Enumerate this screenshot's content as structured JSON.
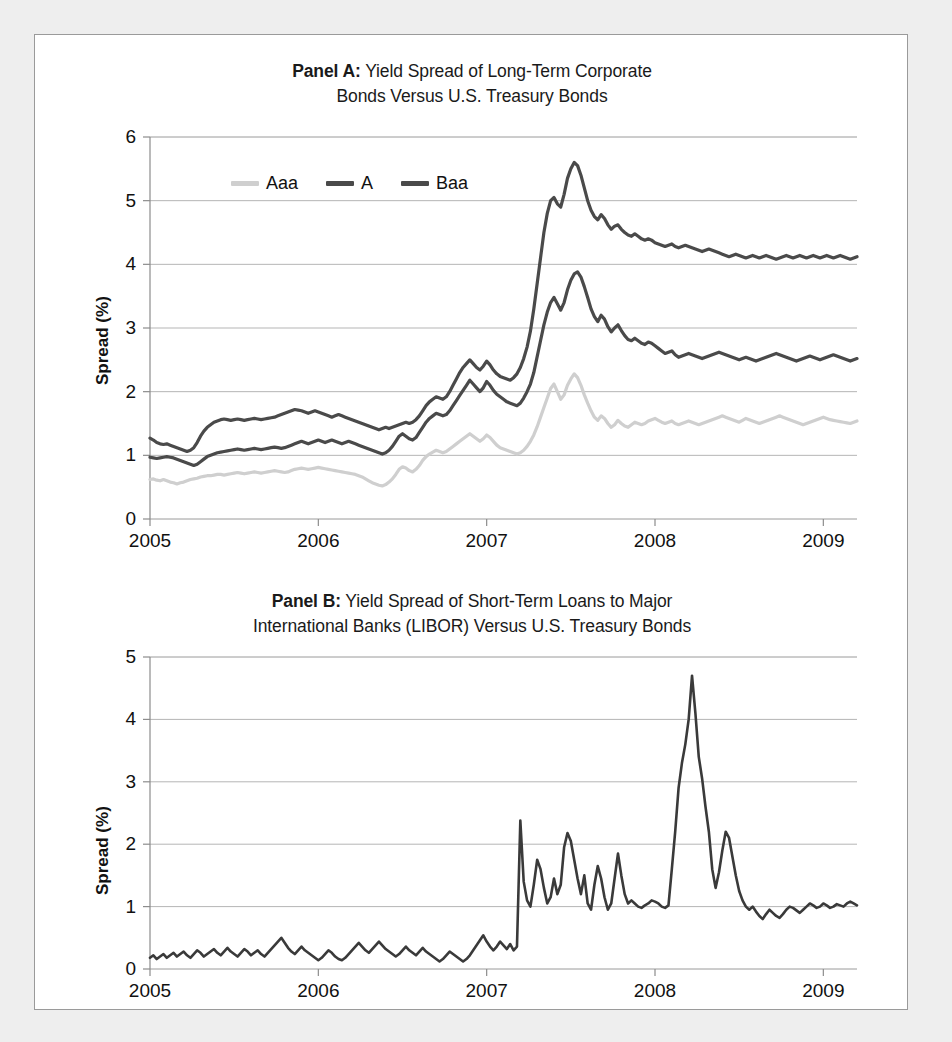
{
  "figure": {
    "background_color": "#eeeeee",
    "card_color": "#ffffff",
    "frame_color": "#9a9a9a"
  },
  "panel_a": {
    "title_lead": "Panel A:",
    "title_rest": " Yield Spread of Long-Term Corporate",
    "title_line2": "Bonds Versus U.S. Treasury Bonds",
    "ylabel": "Spread (%)",
    "yticks": [
      "0",
      "1",
      "2",
      "3",
      "4",
      "5",
      "6"
    ],
    "xticks": [
      "2005",
      "2006",
      "2007",
      "2008",
      "2009"
    ],
    "legend": [
      {
        "label": "Aaa",
        "color": "#cfcfcf"
      },
      {
        "label": "A",
        "color": "#4a4a4a"
      },
      {
        "label": "Baa",
        "color": "#4a4a4a"
      }
    ]
  },
  "panel_b": {
    "title_lead": "Panel B:",
    "title_rest": " Yield Spread of Short-Term Loans to Major",
    "title_line2": "International Banks (LIBOR) Versus U.S. Treasury Bonds",
    "ylabel": "Spread (%)",
    "yticks": [
      "0",
      "1",
      "2",
      "3",
      "4",
      "5"
    ],
    "xticks": [
      "2005",
      "2006",
      "2007",
      "2008",
      "2009"
    ]
  },
  "chart_data": [
    {
      "id": "panel-a",
      "type": "line",
      "title": "Panel A: Yield Spread of Long-Term Corporate Bonds Versus U.S. Treasury Bonds",
      "xlabel": "",
      "ylabel": "Spread (%)",
      "xlim": [
        2005.0,
        2009.2
      ],
      "ylim": [
        0,
        6
      ],
      "xticks": [
        2005,
        2006,
        2007,
        2008,
        2009
      ],
      "yticks": [
        0,
        1,
        2,
        3,
        4,
        5,
        6
      ],
      "grid": true,
      "legend_position": "top-left-inside",
      "x_step": 0.02,
      "series": [
        {
          "name": "Aaa",
          "color": "#cfcfcf",
          "values": [
            0.62,
            0.63,
            0.61,
            0.6,
            0.62,
            0.6,
            0.58,
            0.57,
            0.55,
            0.57,
            0.58,
            0.6,
            0.62,
            0.63,
            0.64,
            0.66,
            0.67,
            0.68,
            0.68,
            0.69,
            0.7,
            0.7,
            0.69,
            0.7,
            0.71,
            0.72,
            0.73,
            0.72,
            0.71,
            0.72,
            0.73,
            0.74,
            0.73,
            0.72,
            0.73,
            0.74,
            0.75,
            0.76,
            0.75,
            0.74,
            0.73,
            0.74,
            0.76,
            0.78,
            0.79,
            0.8,
            0.79,
            0.78,
            0.79,
            0.8,
            0.81,
            0.8,
            0.79,
            0.78,
            0.77,
            0.76,
            0.75,
            0.74,
            0.73,
            0.72,
            0.71,
            0.7,
            0.68,
            0.66,
            0.63,
            0.6,
            0.57,
            0.55,
            0.53,
            0.52,
            0.54,
            0.58,
            0.63,
            0.7,
            0.78,
            0.82,
            0.8,
            0.76,
            0.74,
            0.78,
            0.84,
            0.92,
            0.98,
            1.02,
            1.05,
            1.08,
            1.06,
            1.04,
            1.06,
            1.1,
            1.14,
            1.18,
            1.22,
            1.26,
            1.3,
            1.34,
            1.3,
            1.26,
            1.22,
            1.26,
            1.32,
            1.28,
            1.22,
            1.16,
            1.12,
            1.1,
            1.08,
            1.06,
            1.04,
            1.02,
            1.04,
            1.08,
            1.14,
            1.22,
            1.32,
            1.45,
            1.6,
            1.75,
            1.9,
            2.05,
            2.12,
            2.0,
            1.88,
            1.95,
            2.1,
            2.2,
            2.28,
            2.22,
            2.1,
            1.95,
            1.82,
            1.7,
            1.6,
            1.55,
            1.62,
            1.58,
            1.5,
            1.44,
            1.48,
            1.55,
            1.5,
            1.46,
            1.44,
            1.48,
            1.52,
            1.5,
            1.48,
            1.5,
            1.54,
            1.56,
            1.58,
            1.55,
            1.52,
            1.5,
            1.52,
            1.54,
            1.5,
            1.48,
            1.5,
            1.52,
            1.54,
            1.52,
            1.5,
            1.48,
            1.5,
            1.52,
            1.54,
            1.56,
            1.58,
            1.6,
            1.62,
            1.6,
            1.58,
            1.56,
            1.54,
            1.52,
            1.55,
            1.58,
            1.56,
            1.54,
            1.52,
            1.5,
            1.52,
            1.54,
            1.56,
            1.58,
            1.6,
            1.62,
            1.6,
            1.58,
            1.56,
            1.54,
            1.52,
            1.5,
            1.48,
            1.5,
            1.52,
            1.54,
            1.56,
            1.58,
            1.6,
            1.58,
            1.56,
            1.55,
            1.54,
            1.53,
            1.52,
            1.51,
            1.5,
            1.52,
            1.54
          ]
        },
        {
          "name": "A",
          "color": "#4a4a4a",
          "values": [
            0.97,
            0.96,
            0.95,
            0.96,
            0.97,
            0.98,
            0.97,
            0.96,
            0.94,
            0.92,
            0.9,
            0.88,
            0.86,
            0.84,
            0.86,
            0.9,
            0.94,
            0.98,
            1.0,
            1.02,
            1.04,
            1.05,
            1.06,
            1.07,
            1.08,
            1.09,
            1.1,
            1.09,
            1.08,
            1.09,
            1.1,
            1.11,
            1.1,
            1.09,
            1.1,
            1.11,
            1.12,
            1.13,
            1.12,
            1.11,
            1.12,
            1.14,
            1.16,
            1.18,
            1.2,
            1.22,
            1.2,
            1.18,
            1.2,
            1.22,
            1.24,
            1.22,
            1.2,
            1.22,
            1.24,
            1.22,
            1.2,
            1.18,
            1.2,
            1.22,
            1.2,
            1.18,
            1.16,
            1.14,
            1.12,
            1.1,
            1.08,
            1.06,
            1.04,
            1.02,
            1.04,
            1.08,
            1.14,
            1.22,
            1.3,
            1.34,
            1.3,
            1.26,
            1.24,
            1.28,
            1.36,
            1.44,
            1.52,
            1.58,
            1.62,
            1.66,
            1.64,
            1.62,
            1.64,
            1.7,
            1.78,
            1.86,
            1.94,
            2.02,
            2.1,
            2.18,
            2.12,
            2.06,
            2.0,
            2.06,
            2.16,
            2.1,
            2.02,
            1.96,
            1.92,
            1.88,
            1.84,
            1.82,
            1.8,
            1.78,
            1.82,
            1.9,
            2.0,
            2.12,
            2.3,
            2.55,
            2.8,
            3.05,
            3.25,
            3.4,
            3.48,
            3.38,
            3.28,
            3.4,
            3.6,
            3.75,
            3.85,
            3.88,
            3.8,
            3.65,
            3.48,
            3.3,
            3.18,
            3.1,
            3.2,
            3.14,
            3.02,
            2.94,
            3.0,
            3.05,
            2.96,
            2.88,
            2.82,
            2.8,
            2.84,
            2.8,
            2.76,
            2.74,
            2.78,
            2.76,
            2.72,
            2.68,
            2.64,
            2.6,
            2.62,
            2.64,
            2.58,
            2.54,
            2.56,
            2.58,
            2.6,
            2.58,
            2.56,
            2.54,
            2.52,
            2.54,
            2.56,
            2.58,
            2.6,
            2.62,
            2.6,
            2.58,
            2.56,
            2.54,
            2.52,
            2.5,
            2.52,
            2.54,
            2.52,
            2.5,
            2.48,
            2.5,
            2.52,
            2.54,
            2.56,
            2.58,
            2.6,
            2.58,
            2.56,
            2.54,
            2.52,
            2.5,
            2.48,
            2.5,
            2.52,
            2.54,
            2.56,
            2.54,
            2.52,
            2.5,
            2.52,
            2.54,
            2.56,
            2.58,
            2.56,
            2.54,
            2.52,
            2.5,
            2.48,
            2.5,
            2.52
          ]
        },
        {
          "name": "Baa",
          "color": "#4a4a4a",
          "values": [
            1.27,
            1.24,
            1.2,
            1.18,
            1.17,
            1.18,
            1.16,
            1.14,
            1.12,
            1.1,
            1.08,
            1.06,
            1.08,
            1.12,
            1.2,
            1.3,
            1.38,
            1.44,
            1.48,
            1.52,
            1.54,
            1.56,
            1.57,
            1.56,
            1.55,
            1.56,
            1.57,
            1.56,
            1.55,
            1.56,
            1.57,
            1.58,
            1.57,
            1.56,
            1.57,
            1.58,
            1.59,
            1.6,
            1.62,
            1.64,
            1.66,
            1.68,
            1.7,
            1.72,
            1.71,
            1.7,
            1.68,
            1.66,
            1.68,
            1.7,
            1.68,
            1.66,
            1.64,
            1.62,
            1.6,
            1.62,
            1.64,
            1.62,
            1.6,
            1.58,
            1.56,
            1.54,
            1.52,
            1.5,
            1.48,
            1.46,
            1.44,
            1.42,
            1.4,
            1.42,
            1.44,
            1.42,
            1.44,
            1.46,
            1.48,
            1.5,
            1.52,
            1.5,
            1.52,
            1.56,
            1.62,
            1.7,
            1.78,
            1.84,
            1.88,
            1.92,
            1.9,
            1.88,
            1.92,
            2.0,
            2.1,
            2.2,
            2.3,
            2.38,
            2.44,
            2.5,
            2.44,
            2.38,
            2.34,
            2.4,
            2.48,
            2.42,
            2.34,
            2.28,
            2.24,
            2.22,
            2.2,
            2.18,
            2.22,
            2.28,
            2.38,
            2.52,
            2.7,
            2.95,
            3.3,
            3.7,
            4.1,
            4.5,
            4.8,
            5.0,
            5.05,
            4.95,
            4.9,
            5.1,
            5.35,
            5.5,
            5.6,
            5.55,
            5.4,
            5.2,
            5.0,
            4.85,
            4.75,
            4.7,
            4.78,
            4.72,
            4.62,
            4.55,
            4.6,
            4.62,
            4.55,
            4.5,
            4.46,
            4.44,
            4.48,
            4.44,
            4.4,
            4.38,
            4.4,
            4.38,
            4.34,
            4.32,
            4.3,
            4.28,
            4.3,
            4.32,
            4.28,
            4.26,
            4.28,
            4.3,
            4.28,
            4.26,
            4.24,
            4.22,
            4.2,
            4.22,
            4.24,
            4.22,
            4.2,
            4.18,
            4.16,
            4.14,
            4.12,
            4.14,
            4.16,
            4.14,
            4.12,
            4.1,
            4.12,
            4.14,
            4.12,
            4.1,
            4.12,
            4.14,
            4.12,
            4.1,
            4.08,
            4.1,
            4.12,
            4.14,
            4.12,
            4.1,
            4.12,
            4.14,
            4.12,
            4.1,
            4.12,
            4.14,
            4.12,
            4.1,
            4.12,
            4.14,
            4.12,
            4.1,
            4.12,
            4.14,
            4.12,
            4.1,
            4.08,
            4.1,
            4.12
          ]
        }
      ]
    },
    {
      "id": "panel-b",
      "type": "line",
      "title": "Panel B: Yield Spread of Short-Term Loans to Major International Banks (LIBOR) Versus U.S. Treasury Bonds",
      "xlabel": "",
      "ylabel": "Spread (%)",
      "xlim": [
        2005.0,
        2009.2
      ],
      "ylim": [
        0,
        5
      ],
      "xticks": [
        2005,
        2006,
        2007,
        2008,
        2009
      ],
      "yticks": [
        0,
        1,
        2,
        3,
        4,
        5
      ],
      "grid": true,
      "legend_position": "none",
      "x_step": 0.02,
      "series": [
        {
          "name": "LIBOR spread",
          "color": "#3a3a3a",
          "values": [
            0.18,
            0.22,
            0.16,
            0.2,
            0.24,
            0.18,
            0.22,
            0.26,
            0.2,
            0.24,
            0.28,
            0.22,
            0.18,
            0.24,
            0.3,
            0.26,
            0.2,
            0.24,
            0.28,
            0.32,
            0.26,
            0.22,
            0.28,
            0.34,
            0.28,
            0.24,
            0.2,
            0.26,
            0.32,
            0.28,
            0.22,
            0.26,
            0.3,
            0.24,
            0.2,
            0.26,
            0.32,
            0.38,
            0.44,
            0.5,
            0.42,
            0.34,
            0.28,
            0.24,
            0.3,
            0.36,
            0.3,
            0.26,
            0.22,
            0.18,
            0.14,
            0.18,
            0.24,
            0.3,
            0.26,
            0.2,
            0.16,
            0.14,
            0.18,
            0.24,
            0.3,
            0.36,
            0.42,
            0.36,
            0.3,
            0.26,
            0.32,
            0.38,
            0.44,
            0.38,
            0.32,
            0.28,
            0.24,
            0.2,
            0.24,
            0.3,
            0.36,
            0.3,
            0.26,
            0.22,
            0.28,
            0.34,
            0.28,
            0.24,
            0.2,
            0.16,
            0.12,
            0.16,
            0.22,
            0.28,
            0.24,
            0.2,
            0.16,
            0.12,
            0.16,
            0.22,
            0.3,
            0.38,
            0.46,
            0.54,
            0.44,
            0.36,
            0.3,
            0.36,
            0.44,
            0.38,
            0.32,
            0.4,
            0.3,
            0.36,
            2.38,
            1.4,
            1.1,
            1.0,
            1.35,
            1.75,
            1.6,
            1.3,
            1.05,
            1.15,
            1.45,
            1.2,
            1.35,
            1.95,
            2.18,
            2.05,
            1.75,
            1.45,
            1.2,
            1.5,
            1.05,
            0.95,
            1.35,
            1.65,
            1.45,
            1.15,
            0.95,
            1.05,
            1.45,
            1.85,
            1.5,
            1.2,
            1.05,
            1.1,
            1.05,
            1.0,
            0.98,
            1.02,
            1.05,
            1.1,
            1.08,
            1.05,
            1.0,
            0.98,
            1.02,
            1.6,
            2.2,
            2.9,
            3.3,
            3.6,
            4.0,
            4.7,
            4.1,
            3.4,
            3.05,
            2.6,
            2.2,
            1.6,
            1.3,
            1.55,
            1.9,
            2.2,
            2.1,
            1.8,
            1.5,
            1.25,
            1.1,
            1.0,
            0.95,
            1.0,
            0.92,
            0.85,
            0.8,
            0.88,
            0.95,
            0.9,
            0.85,
            0.82,
            0.88,
            0.95,
            1.0,
            0.98,
            0.94,
            0.9,
            0.95,
            1.0,
            1.05,
            1.02,
            0.98,
            1.0,
            1.05,
            1.02,
            0.98,
            1.0,
            1.04,
            1.02,
            1.0,
            1.05,
            1.08,
            1.05,
            1.02
          ]
        }
      ]
    }
  ]
}
